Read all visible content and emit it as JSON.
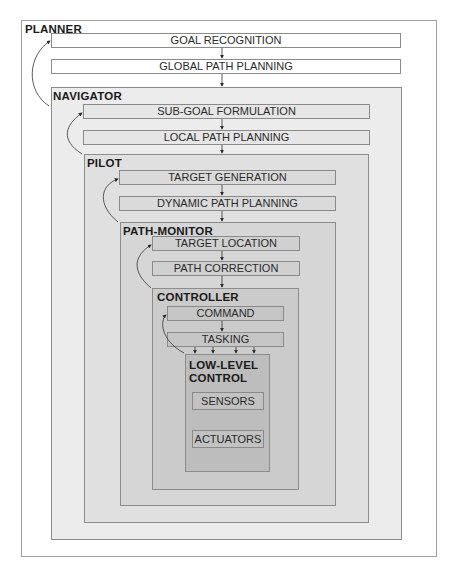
{
  "diagram": {
    "layers": [
      {
        "name": "PLANNER",
        "steps": [
          "GOAL RECOGNITION",
          "GLOBAL PATH PLANNING"
        ]
      },
      {
        "name": "NAVIGATOR",
        "steps": [
          "SUB-GOAL FORMULATION",
          "LOCAL PATH PLANNING"
        ]
      },
      {
        "name": "PILOT",
        "steps": [
          "TARGET GENERATION",
          "DYNAMIC PATH PLANNING"
        ]
      },
      {
        "name": "PATH-MONITOR",
        "steps": [
          "TARGET LOCATION",
          "PATH CORRECTION"
        ]
      },
      {
        "name": "CONTROLLER",
        "steps": [
          "COMMAND",
          "TASKING"
        ]
      },
      {
        "name": "LOW-LEVEL CONTROL",
        "name_line1": "LOW-LEVEL",
        "name_line2": "CONTROL",
        "steps": [
          "SENSORS",
          "ACTUATORS"
        ]
      }
    ],
    "colors": {
      "outer": "#ffffff",
      "navigator": "#ececec",
      "pilot": "#e0e0e0",
      "path_monitor": "#d6d6d6",
      "controller": "#cbcbcb",
      "low_level": "#bdbdbd",
      "border": "#8c8c8c"
    }
  }
}
